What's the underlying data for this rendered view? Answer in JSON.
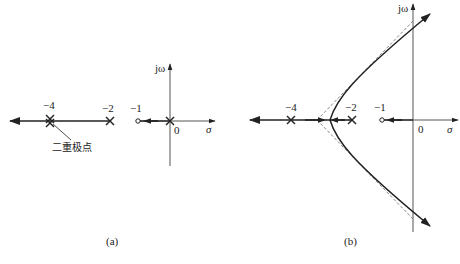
{
  "figure": {
    "panels": [
      {
        "id": "a",
        "caption": "(a)",
        "axes": {
          "real_label": "σ",
          "imag_label": "jω",
          "origin_label": "0"
        },
        "tick_labels": [
          "−4",
          "−2",
          "−1"
        ],
        "annotation": "二重极点",
        "poles": [
          {
            "position": -4,
            "multiplicity": 2
          },
          {
            "position": -2,
            "multiplicity": 1
          },
          {
            "position": 0,
            "multiplicity": 1
          }
        ],
        "zeros": [
          {
            "position": -1
          }
        ]
      },
      {
        "id": "b",
        "caption": "(b)",
        "axes": {
          "real_label": "σ",
          "imag_label": "jω",
          "origin_label": "0"
        },
        "tick_labels": [
          "−4",
          "−2",
          "−1"
        ],
        "poles": [
          {
            "position": -4
          },
          {
            "position": -2
          }
        ],
        "zeros": [
          {
            "position": -1
          }
        ],
        "asymptotes": "dashed",
        "branches": "hyperbola opening left, crossing jω axis"
      }
    ]
  },
  "colors": {
    "line": "#222222",
    "axis": "#555555",
    "dashed": "#777777"
  }
}
